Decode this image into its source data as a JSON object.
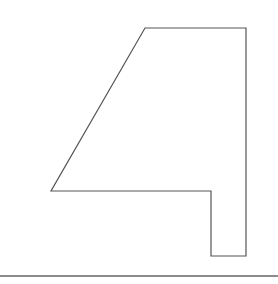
{
  "canvas": {
    "width": 278,
    "height": 284,
    "background": "#ffffff"
  },
  "shape": {
    "kind": "polygon",
    "description": "outline of numeral four",
    "points": "145,28 246,28 246,256 211,256 211,191 51,191",
    "stroke": "#555555",
    "stroke_width": 1.2,
    "fill": "none"
  },
  "baseline": {
    "x1": 0,
    "y1": 276,
    "x2": 278,
    "y2": 276,
    "stroke": "#666666",
    "stroke_width": 1.5
  }
}
